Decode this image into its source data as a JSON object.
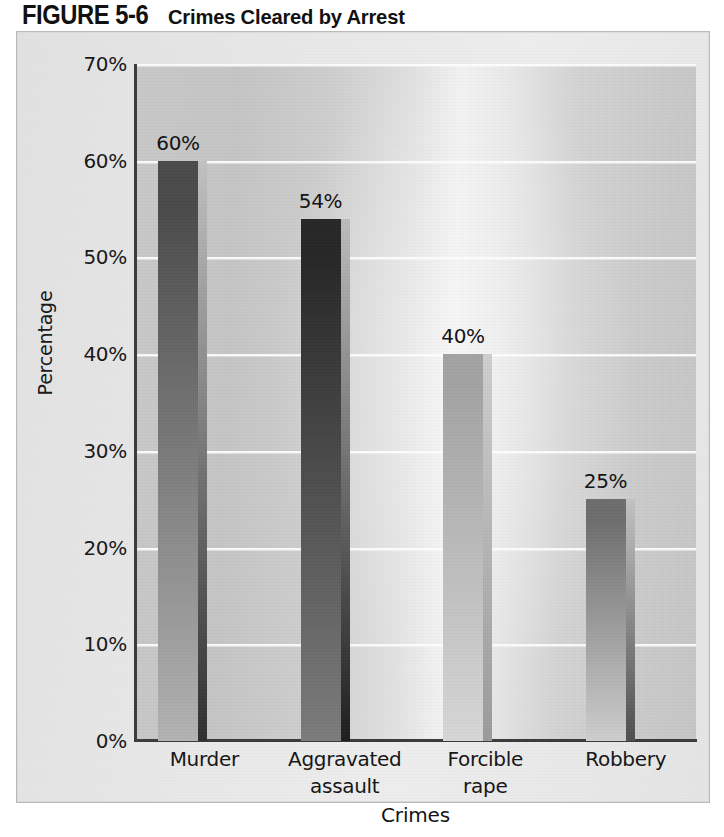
{
  "figure": {
    "number_label": "FIGURE 5-6",
    "caption": "Crimes Cleared by Arrest"
  },
  "chart_data": {
    "type": "bar",
    "title": "Crimes Cleared by Arrest",
    "xlabel": "Crimes",
    "ylabel": "Percentage",
    "categories": [
      "Murder",
      "Aggravated assault",
      "Forcible rape",
      "Robbery"
    ],
    "category_lines": [
      [
        "Murder"
      ],
      [
        "Aggravated",
        "assault"
      ],
      [
        "Forcible",
        "rape"
      ],
      [
        "Robbery"
      ]
    ],
    "values": [
      60,
      54,
      40,
      25
    ],
    "value_labels": [
      "60%",
      "54%",
      "40%",
      "25%"
    ],
    "ylim": [
      0,
      70
    ],
    "ytick_values": [
      0,
      10,
      20,
      30,
      40,
      50,
      60,
      70
    ],
    "ytick_labels": [
      "0%",
      "10%",
      "20%",
      "30%",
      "40%",
      "50%",
      "60%",
      "70%"
    ],
    "grid": true,
    "grid_axis": "y",
    "legend": null,
    "bar_colors": [
      "#5a5a5a",
      "#3a3a3a",
      "#aeaeae",
      "#8a8a8a"
    ],
    "bar_shades": [
      {
        "top": "#4a4a4a",
        "bottom": "#b3b3b3",
        "edge_top": "#c2c2c2",
        "edge_bottom": "#2e2e2e"
      },
      {
        "top": "#262626",
        "bottom": "#7c7c7c",
        "edge_top": "#bdbdbd",
        "edge_bottom": "#1c1c1c"
      },
      {
        "top": "#a3a3a3",
        "bottom": "#d8d8d8",
        "edge_top": "#cfcfcf",
        "edge_bottom": "#9b9b9b"
      },
      {
        "top": "#6d6d6d",
        "bottom": "#cfcfcf",
        "edge_top": "#c4c4c4",
        "edge_bottom": "#4e4e4e"
      }
    ]
  },
  "colors": {
    "panel_background": "#e8e8e8",
    "plot_background": "#d2d2d2",
    "axis": "#3a3a3a",
    "gridline": "#ffffff",
    "text": "#141414"
  }
}
